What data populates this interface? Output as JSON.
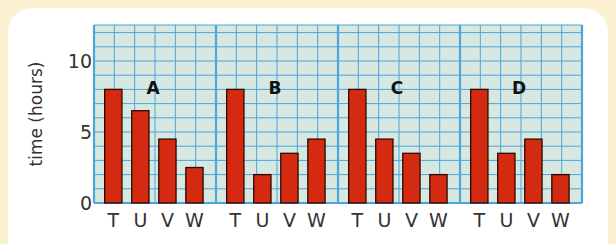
{
  "chart_data": {
    "type": "bar",
    "title": "",
    "xlabel": "",
    "ylabel": "time (hours)",
    "ylim": [
      0,
      13
    ],
    "yticks": [
      0,
      5,
      10
    ],
    "grid": true,
    "panels": [
      {
        "name": "A",
        "categories": [
          "T",
          "U",
          "V",
          "W"
        ],
        "values": [
          8,
          6.5,
          4.5,
          2.5
        ]
      },
      {
        "name": "B",
        "categories": [
          "T",
          "U",
          "V",
          "W"
        ],
        "values": [
          8,
          2,
          3.5,
          4.5
        ]
      },
      {
        "name": "C",
        "categories": [
          "T",
          "U",
          "V",
          "W"
        ],
        "values": [
          8,
          4.5,
          3.5,
          2
        ]
      },
      {
        "name": "D",
        "categories": [
          "T",
          "U",
          "V",
          "W"
        ],
        "values": [
          8,
          3.5,
          4.5,
          2
        ]
      }
    ],
    "bar_color": "#d42a0f",
    "grid_color": "#4aa6dc",
    "plot_background": "#d6e8df"
  },
  "labels": {
    "ylabel": "time (hours)",
    "y0": "0",
    "y5": "5",
    "y10": "10"
  }
}
